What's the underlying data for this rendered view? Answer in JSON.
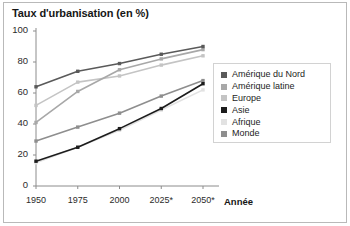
{
  "figure": {
    "title": "Taux d'urbanisation (en %)",
    "background": "#ffffff",
    "border_color": "#b9b9b9"
  },
  "axes": {
    "xlabel": "Année",
    "ylabel": "",
    "x_ticks": [
      "1950",
      "1975",
      "2000",
      "2025*",
      "2050*"
    ],
    "y_ticks": [
      "0",
      "20",
      "40",
      "60",
      "80",
      "100"
    ],
    "axis_color": "#8c8c8c"
  },
  "legend": {
    "position": "right",
    "items": [
      {
        "label": "Amérique du Nord",
        "color": "#5a5a5a"
      },
      {
        "label": "Amérique latine",
        "color": "#a8a8a8"
      },
      {
        "label": "Europe",
        "color": "#c4c4c4"
      },
      {
        "label": "Asie",
        "color": "#1c1c1c"
      },
      {
        "label": "Afrique",
        "color": "#e2e2e2"
      },
      {
        "label": "Monde",
        "color": "#8e8e8e"
      }
    ]
  },
  "chart_data": {
    "type": "line",
    "title": "Taux d'urbanisation (en %)",
    "xlabel": "Année",
    "ylabel": "Taux d'urbanisation (en %)",
    "categories": [
      "1950",
      "1975",
      "2000",
      "2025*",
      "2050*"
    ],
    "xlim": [
      0,
      4
    ],
    "ylim": [
      0,
      100
    ],
    "grid": false,
    "legend_position": "right",
    "series": [
      {
        "name": "Amérique du Nord",
        "color": "#5a5a5a",
        "values": [
          64,
          74,
          79,
          85,
          90
        ]
      },
      {
        "name": "Amérique latine",
        "color": "#a8a8a8",
        "values": [
          41,
          61,
          75,
          82,
          88
        ]
      },
      {
        "name": "Europe",
        "color": "#c4c4c4",
        "values": [
          52,
          67,
          71,
          78,
          84
        ]
      },
      {
        "name": "Asie",
        "color": "#1c1c1c",
        "values": [
          16,
          25,
          37,
          50,
          66
        ]
      },
      {
        "name": "Afrique",
        "color": "#e2e2e2",
        "values": [
          15,
          25,
          36,
          49,
          62
        ]
      },
      {
        "name": "Monde",
        "color": "#8e8e8e",
        "values": [
          29,
          38,
          47,
          58,
          68
        ]
      }
    ]
  }
}
